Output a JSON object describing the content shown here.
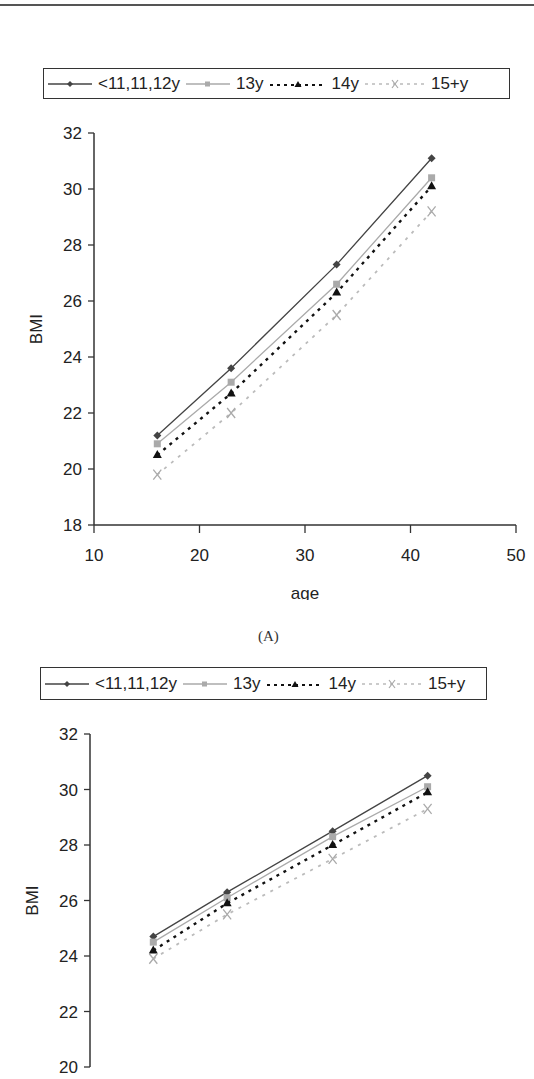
{
  "chart_data": [
    {
      "type": "line",
      "panel_label": "(A)",
      "title": "",
      "xlabel": "age",
      "ylabel": "BMI",
      "xlim": [
        10,
        50
      ],
      "ylim": [
        18,
        32
      ],
      "xticks": [
        10,
        20,
        30,
        40,
        50
      ],
      "yticks": [
        18,
        20,
        22,
        24,
        26,
        28,
        30,
        32
      ],
      "grid": false,
      "legend_position": "top",
      "x": [
        16,
        23,
        33,
        42
      ],
      "series": [
        {
          "name": "<11,11,12y",
          "values": [
            21.2,
            23.6,
            27.3,
            31.1
          ],
          "color": "#444444",
          "style": "solid",
          "marker": "diamond"
        },
        {
          "name": "13y",
          "values": [
            20.9,
            23.1,
            26.6,
            30.4
          ],
          "color": "#aaaaaa",
          "style": "solid",
          "marker": "square"
        },
        {
          "name": "14y",
          "values": [
            20.5,
            22.7,
            26.3,
            30.1
          ],
          "color": "#111111",
          "style": "dashed",
          "marker": "triangle"
        },
        {
          "name": "15+y",
          "values": [
            19.8,
            22.0,
            25.5,
            29.2
          ],
          "color": "#aaaaaa",
          "style": "dotted",
          "marker": "x"
        }
      ]
    },
    {
      "type": "line",
      "panel_label": "",
      "title": "",
      "xlabel": "",
      "ylabel": "BMI",
      "xlim": [
        10,
        50
      ],
      "ylim": [
        20,
        32
      ],
      "xticks": [],
      "yticks": [
        20,
        22,
        24,
        26,
        28,
        30,
        32
      ],
      "grid": false,
      "legend_position": "top",
      "x": [
        16,
        23,
        33,
        42
      ],
      "series": [
        {
          "name": "<11,11,12y",
          "values": [
            24.7,
            26.3,
            28.5,
            30.5
          ],
          "color": "#444444",
          "style": "solid",
          "marker": "diamond"
        },
        {
          "name": "13y",
          "values": [
            24.5,
            26.1,
            28.3,
            30.1
          ],
          "color": "#aaaaaa",
          "style": "solid",
          "marker": "square"
        },
        {
          "name": "14y",
          "values": [
            24.2,
            25.9,
            28.0,
            29.9
          ],
          "color": "#111111",
          "style": "dashed",
          "marker": "triangle"
        },
        {
          "name": "15+y",
          "values": [
            23.9,
            25.5,
            27.5,
            29.3
          ],
          "color": "#aaaaaa",
          "style": "dotted",
          "marker": "x"
        }
      ]
    }
  ],
  "legend": {
    "items": [
      {
        "label": "<11,11,12y"
      },
      {
        "label": "13y"
      },
      {
        "label": "14y"
      },
      {
        "label": "15+y"
      }
    ]
  }
}
